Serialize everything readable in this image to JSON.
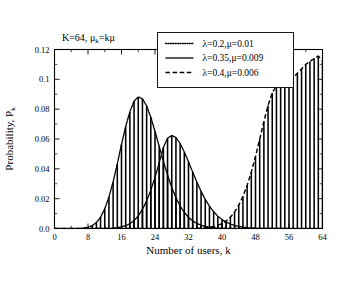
{
  "chart_data": {
    "type": "bar",
    "title": "",
    "annotation": "K=64, μₖ=kμ",
    "annotation_parts": {
      "prefix": "K=64, ",
      "mu": "μ",
      "sub": "k",
      "suffix": "=kμ"
    },
    "xlabel": "Number of users, k",
    "ylabel_prefix": "Probability, P",
    "ylabel_sub": "k",
    "xlim": [
      0,
      64
    ],
    "ylim": [
      0,
      0.12
    ],
    "grid": false,
    "xticks": [
      0,
      8,
      16,
      24,
      32,
      40,
      48,
      56,
      64
    ],
    "xtick_labels": [
      "0",
      "8",
      "16",
      "24",
      "32",
      "40",
      "48",
      "56",
      "64"
    ],
    "xminor_step": 4,
    "yticks": [
      0,
      0.02,
      0.04,
      0.06,
      0.08,
      0.1,
      0.12
    ],
    "ytick_labels": [
      "0.0",
      "0.02",
      "0.04",
      "0.06",
      "0.08",
      "0.1",
      "0.12"
    ],
    "yminor_step": 0.01,
    "legend_position": "top-center-right",
    "x": [
      0,
      1,
      2,
      3,
      4,
      5,
      6,
      7,
      8,
      9,
      10,
      11,
      12,
      13,
      14,
      15,
      16,
      17,
      18,
      19,
      20,
      21,
      22,
      23,
      24,
      25,
      26,
      27,
      28,
      29,
      30,
      31,
      32,
      33,
      34,
      35,
      36,
      37,
      38,
      39,
      40,
      41,
      42,
      43,
      44,
      45,
      46,
      47,
      48,
      49,
      50,
      51,
      52,
      53,
      54,
      55,
      56,
      57,
      58,
      59,
      60,
      61,
      62,
      63,
      64
    ],
    "series": [
      {
        "name": "λ=0.2,μ=0.01",
        "label_parts": {
          "lambda": "λ",
          "lam_val": "=0.2,",
          "mu": "μ",
          "mu_val": "=0.01"
        },
        "linestyle": "dotted",
        "color": "#000000",
        "values": [
          0.0,
          0.0,
          0.0,
          0.0,
          1e-05,
          3e-05,
          0.0001,
          0.0003,
          0.0008,
          0.0019,
          0.004,
          0.0076,
          0.0132,
          0.0211,
          0.0313,
          0.0434,
          0.0564,
          0.0684,
          0.0783,
          0.0853,
          0.0882,
          0.087,
          0.0822,
          0.0746,
          0.0652,
          0.0551,
          0.0451,
          0.0358,
          0.0276,
          0.0207,
          0.0151,
          0.0108,
          0.0075,
          0.0051,
          0.0034,
          0.0022,
          0.0014,
          0.00086,
          0.00052,
          0.00031,
          0.00018,
          0.0001,
          6e-05,
          3e-05,
          2e-05,
          1e-05,
          0.0,
          0.0,
          0.0,
          0.0,
          0.0,
          0.0,
          0.0,
          0.0,
          0.0,
          0.0,
          0.0,
          0.0,
          0.0,
          0.0,
          0.0,
          0.0,
          0.0,
          0.0,
          0.0
        ]
      },
      {
        "name": "λ=0.35,μ=0.009",
        "label_parts": {
          "lambda": "λ",
          "lam_val": "=0.35,",
          "mu": "μ",
          "mu_val": "=0.009"
        },
        "linestyle": "solid",
        "color": "#000000",
        "values": [
          0.0,
          0.0,
          0.0,
          0.0,
          0.0,
          0.0,
          0.0,
          0.0,
          0.0,
          0.0,
          1e-05,
          2e-05,
          5e-05,
          0.00012,
          0.00026,
          0.00053,
          0.00103,
          0.00188,
          0.00326,
          0.00538,
          0.00848,
          0.0128,
          0.0185,
          0.0257,
          0.0343,
          0.044,
          0.0543,
          0.0605,
          0.0623,
          0.061,
          0.057,
          0.0513,
          0.0447,
          0.0378,
          0.0311,
          0.0249,
          0.0195,
          0.015,
          0.0112,
          0.0083,
          0.006,
          0.0043,
          0.003,
          0.0021,
          0.0014,
          0.00095,
          0.00062,
          0.0004,
          0.00025,
          0.00016,
          0.0001,
          6e-05,
          3e-05,
          2e-05,
          1e-05,
          1e-05,
          0.0,
          0.0,
          0.0,
          0.0,
          0.0,
          0.0,
          0.0,
          0.0,
          0.0
        ],
        "note": "peak approx 0.063 near k=39 in rendered figure"
      },
      {
        "name": "λ=0.4,μ=0.006",
        "label_parts": {
          "lambda": "λ",
          "lam_val": "=0.4,",
          "mu": "μ",
          "mu_val": "=0.006"
        },
        "linestyle": "dashed",
        "color": "#000000",
        "values": [
          0.0,
          0.0,
          0.0,
          0.0,
          0.0,
          0.0,
          0.0,
          0.0,
          0.0,
          0.0,
          0.0,
          0.0,
          0.0,
          0.0,
          0.0,
          0.0,
          0.0,
          0.0,
          0.0,
          0.0,
          0.0,
          0.0,
          0.0,
          0.0,
          0.0,
          0.0,
          0.0,
          0.0,
          0.0,
          1e-05,
          1e-05,
          2e-05,
          4e-05,
          8e-05,
          0.00015,
          0.00027,
          0.00047,
          0.0008,
          0.00132,
          0.00213,
          0.00334,
          0.0051,
          0.0076,
          0.011,
          0.0156,
          0.0215,
          0.0289,
          0.0379,
          0.0483,
          0.0599,
          0.0718,
          0.0825,
          0.0908,
          0.0957,
          0.0974,
          0.0977,
          0.0988,
          0.101,
          0.104,
          0.107,
          0.11,
          0.112,
          0.114,
          0.1155,
          0.113
        ],
        "note": "monotone rise to approx 0.115 near k=63"
      }
    ],
    "peaks": [
      {
        "series": "λ=0.2,μ=0.01",
        "k": 20,
        "value": 0.088
      },
      {
        "series": "λ=0.35,μ=0.009",
        "k": 39,
        "value": 0.063
      },
      {
        "series": "λ=0.4,μ=0.006",
        "k": 63,
        "value": 0.115
      }
    ]
  },
  "legend": {
    "entries": [
      {
        "sample": "dotted",
        "text": "λ=0.2,μ=0.01"
      },
      {
        "sample": "solid",
        "text": "λ=0.35,μ=0.009"
      },
      {
        "sample": "dashed",
        "text": "λ=0.4,μ=0.006"
      }
    ]
  }
}
